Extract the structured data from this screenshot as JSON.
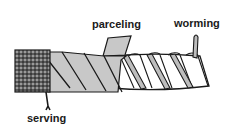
{
  "figure": {
    "type": "diagram",
    "labels": {
      "parceling": "parceling",
      "worming": "worming",
      "serving": "serving"
    },
    "colors": {
      "outline": "#1a1a1a",
      "parceling_fill": "#c8c8c8",
      "rope_fill": "#ffffff",
      "worming_fill": "#bdbdbd",
      "serving_fill": "#9a9a9a",
      "background": "#ffffff"
    }
  }
}
